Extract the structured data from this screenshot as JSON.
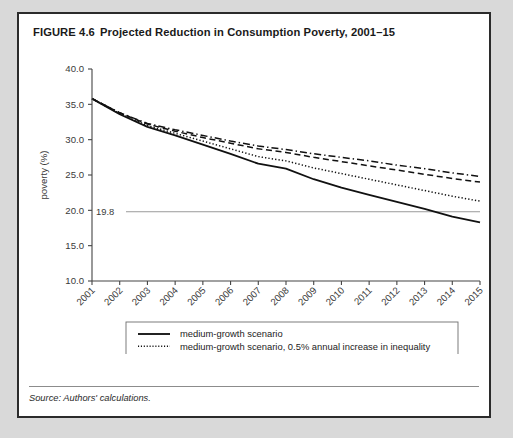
{
  "figure": {
    "number": "FIGURE 4.6",
    "title": "Projected Reduction in Consumption Poverty, 2001–15",
    "source": "Source: Authors' calculations."
  },
  "chart_data": {
    "type": "line",
    "title": "Projected Reduction in Consumption Poverty, 2001–15",
    "xlabel": "year",
    "ylabel": "poverty (%)",
    "x": [
      2001,
      2002,
      2003,
      2004,
      2005,
      2006,
      2007,
      2008,
      2009,
      2010,
      2011,
      2012,
      2013,
      2014,
      2015
    ],
    "categories": [
      "2001",
      "2002",
      "2003",
      "2004",
      "2005",
      "2006",
      "2007",
      "2008",
      "2009",
      "2010",
      "2011",
      "2012",
      "2013",
      "2014",
      "2015"
    ],
    "xlim": [
      2001,
      2015
    ],
    "ylim": [
      10.0,
      40.0
    ],
    "yticks": [
      "40.0",
      "35.0",
      "30.0",
      "25.0",
      "20.0",
      "15.0",
      "10.0"
    ],
    "ytick_values": [
      40.0,
      35.0,
      30.0,
      25.0,
      20.0,
      15.0,
      10.0
    ],
    "grid": false,
    "legend_position": "below-plot",
    "annotations": [
      {
        "name": "reference-line",
        "label": "19.8",
        "value": 19.8,
        "style": "horizontal-line"
      }
    ],
    "series": [
      {
        "name": "medium-growth scenario",
        "style": "solid",
        "values": [
          35.8,
          33.6,
          31.8,
          30.6,
          29.3,
          28.0,
          26.6,
          25.9,
          24.4,
          23.2,
          22.2,
          21.2,
          20.2,
          19.1,
          18.3
        ]
      },
      {
        "name": "medium-growth scenario, 0.5% annual increase in inequality",
        "style": "dotted",
        "values": [
          35.8,
          33.7,
          32.0,
          30.9,
          29.8,
          28.7,
          27.6,
          27.0,
          26.0,
          25.2,
          24.4,
          23.6,
          22.8,
          22.0,
          21.3
        ]
      },
      {
        "name": "medium-growth scenario, 1.0% annual increase in inequality",
        "style": "dashed",
        "values": [
          35.8,
          33.8,
          32.2,
          31.2,
          30.3,
          29.5,
          28.7,
          28.2,
          27.5,
          26.9,
          26.3,
          25.7,
          25.1,
          24.5,
          24.0
        ]
      },
      {
        "name": "low-growth scenario, unchanged inequality",
        "style": "dash-dot",
        "values": [
          35.8,
          33.8,
          32.3,
          31.4,
          30.6,
          29.8,
          29.1,
          28.6,
          28.0,
          27.5,
          27.0,
          26.4,
          25.9,
          25.3,
          24.8
        ]
      }
    ]
  },
  "colors": {
    "line": "#111111",
    "axis": "#444444",
    "reference": "#8f8f8f",
    "border": "#2b2b2b",
    "page_background": "#d9d9d9",
    "figure_background": "#ffffff"
  }
}
